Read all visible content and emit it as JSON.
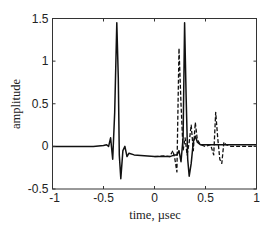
{
  "chart_data": {
    "type": "line",
    "title": "",
    "xlabel": "time, µsec",
    "ylabel": "amplitude",
    "xlim": [
      -1,
      1
    ],
    "ylim": [
      -0.5,
      1.5
    ],
    "xticks": [
      -1,
      -0.5,
      0,
      0.5,
      1
    ],
    "xtick_labels": [
      "-1",
      "-0.5",
      "0",
      "0.5",
      "1"
    ],
    "yticks": [
      -0.5,
      0,
      0.5,
      1,
      1.5
    ],
    "ytick_labels": [
      "-0.5",
      "0",
      "0.5",
      "1",
      "1.5"
    ],
    "grid": false,
    "legend": null,
    "series": [
      {
        "name": "solid",
        "style": "solid",
        "color": "#111111",
        "x": [
          -1.0,
          -0.6,
          -0.5,
          -0.47,
          -0.45,
          -0.43,
          -0.41,
          -0.39,
          -0.37,
          -0.355,
          -0.345,
          -0.33,
          -0.31,
          -0.29,
          -0.27,
          -0.25,
          -0.2,
          -0.1,
          0.0,
          0.1,
          0.15,
          0.2,
          0.22,
          0.24,
          0.26,
          0.28,
          0.295,
          0.31,
          0.325,
          0.34,
          0.36,
          0.38,
          0.4,
          0.42,
          0.45,
          0.5,
          0.55,
          0.6,
          0.65,
          0.7,
          0.8,
          0.9,
          1.0
        ],
        "y": [
          0.0,
          0.0,
          0.01,
          0.02,
          0.0,
          0.1,
          -0.15,
          0.4,
          1.45,
          0.8,
          -0.1,
          -0.38,
          -0.05,
          0.0,
          -0.12,
          -0.08,
          -0.1,
          -0.11,
          -0.12,
          -0.12,
          -0.12,
          -0.1,
          -0.1,
          -0.05,
          -0.18,
          0.1,
          1.45,
          0.6,
          -0.15,
          -0.35,
          -0.2,
          0.05,
          0.12,
          0.05,
          0.02,
          0.02,
          0.02,
          0.02,
          0.02,
          0.02,
          0.02,
          0.02,
          0.02
        ],
        "annotations": [
          "peak ~1.45 at t≈-0.37",
          "peak ~1.45 at t≈+0.31"
        ]
      },
      {
        "name": "dashed",
        "style": "dashed",
        "color": "#111111",
        "x": [
          0.0,
          0.1,
          0.15,
          0.18,
          0.2,
          0.22,
          0.24,
          0.26,
          0.28,
          0.3,
          0.32,
          0.34,
          0.36,
          0.38,
          0.4,
          0.42,
          0.45,
          0.5,
          0.55,
          0.58,
          0.6,
          0.62,
          0.64,
          0.66,
          0.68,
          0.7,
          0.75,
          1.0
        ],
        "y": [
          -0.12,
          -0.11,
          -0.12,
          -0.05,
          -0.15,
          -0.3,
          1.15,
          0.5,
          -0.05,
          0.1,
          -0.1,
          0.05,
          0.25,
          -0.05,
          0.28,
          0.08,
          0.02,
          0.0,
          0.02,
          -0.1,
          0.4,
          0.1,
          -0.15,
          -0.2,
          0.05,
          0.02,
          0.0,
          0.0
        ],
        "annotations": [
          "peak ~1.15 at t≈+0.24"
        ]
      }
    ]
  },
  "axes": {
    "x_label": "time, µsec",
    "y_label": "amplitude"
  }
}
